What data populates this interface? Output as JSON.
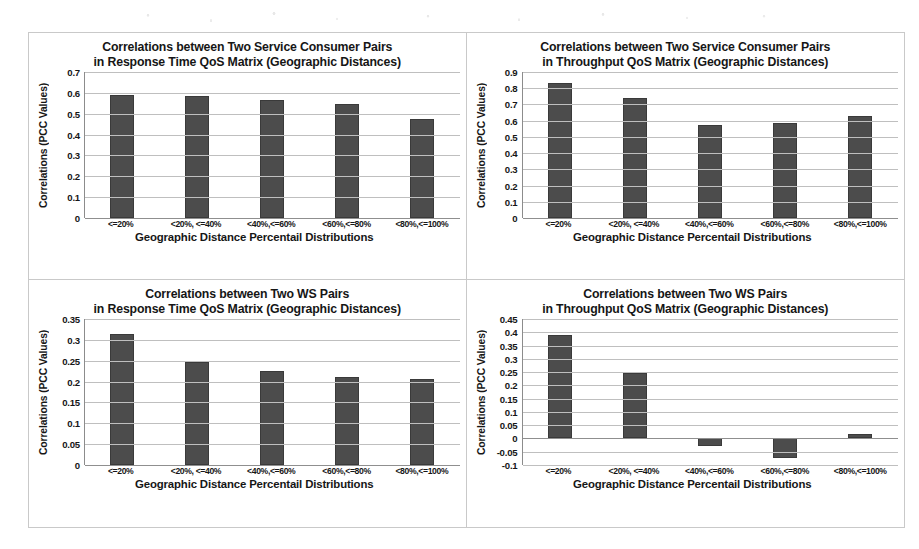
{
  "figure": {
    "panel_count": 4,
    "bar_color": "#4c4c4c",
    "grid_color": "#bfbfbf",
    "frame_color": "#c9c9c9"
  },
  "shared": {
    "ylabel": "Correlations (PCC Values)",
    "xlabel": "Geographic Distance Percentail Distributions",
    "categories": [
      "<=20%",
      "<20%, <=40%",
      "<40%,<=60%",
      "<60%,<=80%",
      "<80%,<=100%"
    ]
  },
  "chart_data": [
    {
      "id": "top-left",
      "type": "bar",
      "title": "Correlations between Two Service Consumer Pairs in Response Time QoS Matrix (Geographic Distances)",
      "title_line1": "Correlations between Two Service Consumer Pairs",
      "title_line2": "in Response Time QoS Matrix (Geographic Distances)",
      "xlabel": "Geographic Distance Percentail Distributions",
      "ylabel": "Correlations (PCC Values)",
      "categories": [
        "<=20%",
        "<20%, <=40%",
        "<40%,<=60%",
        "<60%,<=80%",
        "<80%,<=100%"
      ],
      "values": [
        0.59,
        0.585,
        0.565,
        0.545,
        0.475
      ],
      "ylim": [
        0,
        0.7
      ],
      "ytick_step": 0.1,
      "yticks": [
        "0.7",
        "0.6",
        "0.5",
        "0.4",
        "0.3",
        "0.2",
        "0.1",
        "0"
      ],
      "ytick_values": [
        0.7,
        0.6,
        0.5,
        0.4,
        0.3,
        0.2,
        0.1,
        0
      ],
      "grid": true,
      "legend": "none"
    },
    {
      "id": "top-right",
      "type": "bar",
      "title": "Correlations between Two Service Consumer Pairs in Throughput QoS Matrix (Geographic Distances)",
      "title_line1": "Correlations between Two Service Consumer Pairs",
      "title_line2": "in Throughput QoS Matrix (Geographic Distances)",
      "xlabel": "Geographic Distance Percentail Distributions",
      "ylabel": "Correlations (PCC Values)",
      "categories": [
        "<=20%",
        "<20%, <=40%",
        "<40%,<=60%",
        "<60%,<=80%",
        "<80%,<=100%"
      ],
      "values": [
        0.83,
        0.74,
        0.575,
        0.585,
        0.63
      ],
      "ylim": [
        0,
        0.9
      ],
      "ytick_step": 0.1,
      "yticks": [
        "0.9",
        "0.8",
        "0.7",
        "0.6",
        "0.5",
        "0.4",
        "0.3",
        "0.2",
        "0.1",
        "0"
      ],
      "ytick_values": [
        0.9,
        0.8,
        0.7,
        0.6,
        0.5,
        0.4,
        0.3,
        0.2,
        0.1,
        0
      ],
      "grid": true,
      "legend": "none"
    },
    {
      "id": "bottom-left",
      "type": "bar",
      "title": "Correlations between Two WS Pairs in Response Time QoS Matrix (Geographic Distances)",
      "title_line1": "Correlations between Two WS Pairs",
      "title_line2": "in Response Time QoS Matrix (Geographic Distances)",
      "xlabel": "Geographic Distance Percentail Distributions",
      "ylabel": "Correlations (PCC Values)",
      "categories": [
        "<=20%",
        "<20%, <=40%",
        "<40%,<=60%",
        "<60%,<=80%",
        "<80%,<=100%"
      ],
      "values": [
        0.315,
        0.247,
        0.226,
        0.211,
        0.207
      ],
      "ylim": [
        0,
        0.35
      ],
      "ytick_step": 0.05,
      "yticks": [
        "0.35",
        "0.3",
        "0.25",
        "0.2",
        "0.15",
        "0.1",
        "0.05",
        "0"
      ],
      "ytick_values": [
        0.35,
        0.3,
        0.25,
        0.2,
        0.15,
        0.1,
        0.05,
        0
      ],
      "grid": true,
      "legend": "none"
    },
    {
      "id": "bottom-right",
      "type": "bar",
      "title": "Correlations between Two WS Pairs in Throughput QoS Matrix (Geographic Distances)",
      "title_line1": "Correlations between Two WS Pairs",
      "title_line2": "in Throughput QoS Matrix (Geographic Distances)",
      "xlabel": "Geographic Distance Percentail Distributions",
      "ylabel": "Correlations (PCC Values)",
      "categories": [
        "<=20%",
        "<20%, <=40%",
        "<40%,<=60%",
        "<60%,<=80%",
        "<80%,<=100%"
      ],
      "values": [
        0.39,
        0.248,
        -0.03,
        -0.075,
        0.018
      ],
      "ylim": [
        -0.1,
        0.45
      ],
      "ytick_step": 0.05,
      "yticks": [
        "0.45",
        "0.4",
        "0.35",
        "0.3",
        "0.25",
        "0.2",
        "0.15",
        "0.1",
        "0.05",
        "0",
        "-0.05",
        "-0.1"
      ],
      "ytick_values": [
        0.45,
        0.4,
        0.35,
        0.3,
        0.25,
        0.2,
        0.15,
        0.1,
        0.05,
        0,
        -0.05,
        -0.1
      ],
      "grid": true,
      "legend": "none"
    }
  ]
}
